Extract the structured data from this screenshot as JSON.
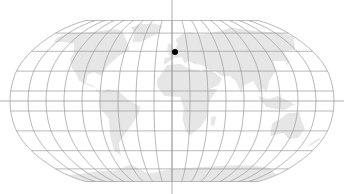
{
  "map": {
    "projection": "Robinson-like",
    "width": 344,
    "height": 194,
    "center": {
      "x": 172,
      "y": 101
    },
    "extent": {
      "left": 10,
      "right": 334,
      "top": 15,
      "bottom": 176
    },
    "graticule": {
      "meridian_step_deg": 20,
      "parallel_step_deg": 20,
      "color": "#9a9a9a"
    },
    "land_color": "#e6e6e6",
    "background_color": "#ffffff",
    "crosshair": {
      "vertical_x": 172,
      "horizontal_y": 101,
      "color": "#9a9a9a"
    },
    "markers": [
      {
        "name": "location-marker",
        "x": 175,
        "y": 52,
        "radius": 3,
        "color": "#000000",
        "approx_region": "Western Europe (France)"
      }
    ]
  }
}
